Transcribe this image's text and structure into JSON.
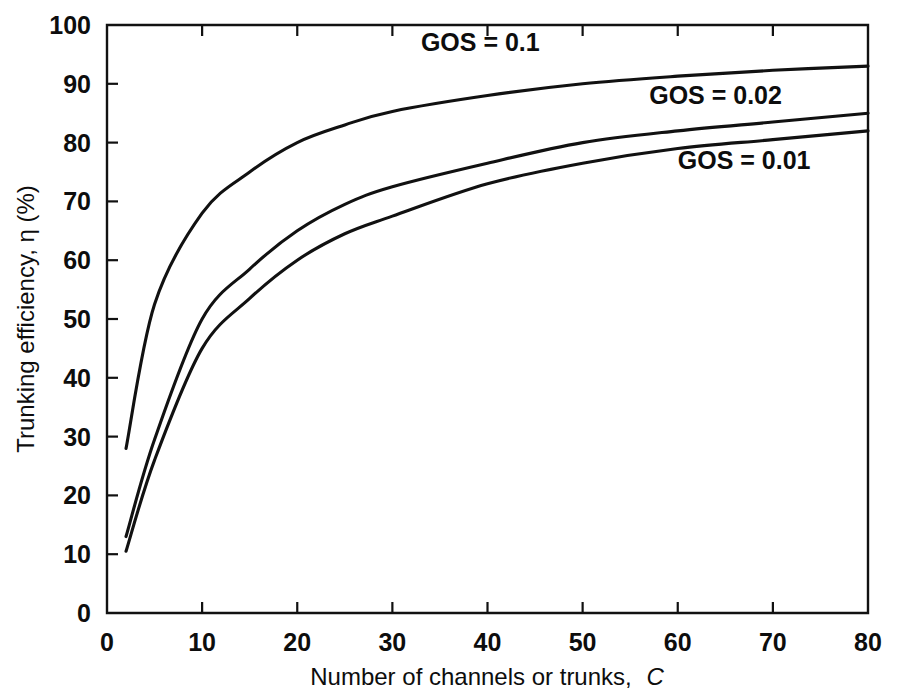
{
  "chart_data": {
    "type": "line",
    "title": "",
    "xlabel": "Number of channels or trunks, C",
    "xlabel_plain": "Number of channels or trunks,",
    "xlabel_variable": "C",
    "ylabel": "Trunking efficiency, η (%)",
    "xlim": [
      0,
      80
    ],
    "ylim": [
      0,
      100
    ],
    "xticks": [
      0,
      10,
      20,
      30,
      40,
      50,
      60,
      70,
      80
    ],
    "yticks": [
      0,
      10,
      20,
      30,
      40,
      50,
      60,
      70,
      80,
      90,
      100
    ],
    "xtick_labels": [
      "0",
      "10",
      "20",
      "30",
      "40",
      "50",
      "60",
      "70",
      "80"
    ],
    "ytick_labels": [
      "0",
      "10",
      "20",
      "30",
      "40",
      "50",
      "60",
      "70",
      "80",
      "90",
      "100"
    ],
    "grid": false,
    "legend_position": "inline-annotations",
    "line_color": "#111111",
    "background_color": "#ffffff",
    "series": [
      {
        "name": "GOS = 0.1",
        "label": "GOS = 0.1",
        "label_x": 33,
        "label_y": 95.5,
        "x": [
          2,
          5,
          10,
          15,
          20,
          25,
          30,
          40,
          50,
          60,
          70,
          80
        ],
        "values": [
          28.0,
          52.5,
          68.0,
          75.0,
          80.0,
          83.0,
          85.3,
          88.0,
          90.0,
          91.3,
          92.3,
          93.0
        ]
      },
      {
        "name": "GOS = 0.02",
        "label": "GOS = 0.02",
        "label_x": 57,
        "label_y": 86.5,
        "x": [
          2,
          5,
          10,
          15,
          20,
          25,
          30,
          40,
          50,
          60,
          70,
          80
        ],
        "values": [
          13.0,
          29.5,
          50.0,
          58.5,
          65.0,
          69.5,
          72.5,
          76.5,
          80.0,
          82.0,
          83.5,
          85.0
        ]
      },
      {
        "name": "GOS = 0.01",
        "label": "GOS = 0.01",
        "label_x": 60,
        "label_y": 75.5,
        "x": [
          2,
          5,
          10,
          15,
          20,
          25,
          30,
          40,
          50,
          60,
          70,
          80
        ],
        "values": [
          10.5,
          26.0,
          45.0,
          53.5,
          60.0,
          64.5,
          67.5,
          73.0,
          76.5,
          79.0,
          80.5,
          82.0
        ]
      }
    ]
  }
}
